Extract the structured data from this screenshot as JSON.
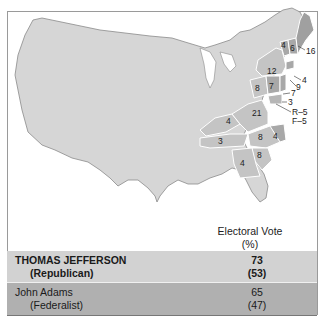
{
  "map": {
    "title": "Election of 1800",
    "base_color": "#d6d6d6",
    "republican_color": "#c4c4c4",
    "federalist_color": "#a8a8a8",
    "state_labels": [
      {
        "id": "NH",
        "value": "6"
      },
      {
        "id": "VT",
        "value": "4"
      },
      {
        "id": "MA",
        "value": "16"
      },
      {
        "id": "NY",
        "value": "12"
      },
      {
        "id": "RI",
        "value": "4"
      },
      {
        "id": "CT",
        "value": "9"
      },
      {
        "id": "NJ",
        "value": "7"
      },
      {
        "id": "PA",
        "value": "8"
      },
      {
        "id": "PA-F",
        "value": "7"
      },
      {
        "id": "DE",
        "value": "3"
      },
      {
        "id": "MD-R",
        "value": "R–5"
      },
      {
        "id": "MD-F",
        "value": "F–5"
      },
      {
        "id": "VA",
        "value": "21"
      },
      {
        "id": "KY",
        "value": "4"
      },
      {
        "id": "TN",
        "value": "3"
      },
      {
        "id": "NC-R",
        "value": "8"
      },
      {
        "id": "NC-F",
        "value": "4"
      },
      {
        "id": "SC",
        "value": "8"
      },
      {
        "id": "GA",
        "value": "4"
      }
    ]
  },
  "legend": {
    "header_line1": "Electoral Vote",
    "header_line2": "(%)",
    "rows": [
      {
        "name": "THOMAS JEFFERSON",
        "party": "(Republican)",
        "votes": "73",
        "percent": "(53)",
        "color": "#d2d2d2"
      },
      {
        "name": "John Adams",
        "party": "(Federalist)",
        "votes": "65",
        "percent": "(47)",
        "color": "#b0b0b0"
      }
    ]
  }
}
